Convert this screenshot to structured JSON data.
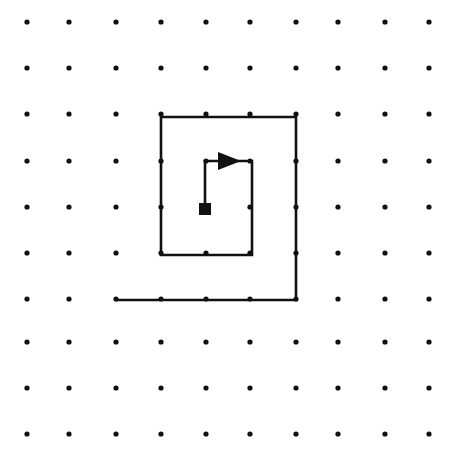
{
  "diagram": {
    "canvas": {
      "width": 461,
      "height": 470,
      "background": "#ffffff"
    },
    "ink_color": "#111111",
    "grid": {
      "name": "dot-grid",
      "columns_x": [
        27,
        69,
        116,
        161,
        206,
        250,
        296,
        338,
        385,
        429
      ],
      "rows_y": [
        22,
        68,
        114,
        161,
        207,
        253,
        299,
        342,
        388,
        434
      ],
      "dot_radius": 2.6,
      "dot_color": "#111111",
      "column_count": 10,
      "row_count": 10
    },
    "start_marker": {
      "name": "start-square-marker",
      "shape": "filled-square",
      "x": 205,
      "y": 209,
      "size": 12,
      "color": "#111111"
    },
    "arrow_head": {
      "name": "direction-arrow",
      "direction": "right",
      "tip_x": 241,
      "tip_y": 161,
      "length": 23,
      "half_height": 9,
      "color": "#111111"
    },
    "path": {
      "name": "square-spiral-polyline",
      "stroke_width": 2.6,
      "vertices": [
        {
          "x": 205,
          "y": 205,
          "label": "start-center"
        },
        {
          "x": 205,
          "y": 161,
          "label": "up-to-inner-top"
        },
        {
          "x": 252,
          "y": 161,
          "label": "right-inner-top"
        },
        {
          "x": 252,
          "y": 255,
          "label": "down-inner-right"
        },
        {
          "x": 161,
          "y": 255,
          "label": "left-inner-bottom"
        },
        {
          "x": 161,
          "y": 117,
          "label": "up-outer-left"
        },
        {
          "x": 296,
          "y": 117,
          "label": "right-outer-top"
        },
        {
          "x": 296,
          "y": 300,
          "label": "down-outer-right"
        },
        {
          "x": 116,
          "y": 300,
          "label": "left-outer-bottom-end"
        }
      ],
      "turn_count": 7,
      "winding": "clockwise"
    }
  }
}
